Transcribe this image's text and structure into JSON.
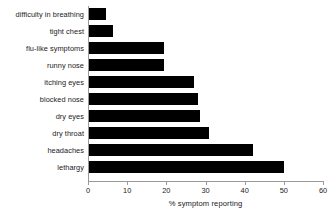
{
  "chart_data": {
    "type": "bar",
    "orientation": "horizontal",
    "title": "",
    "subtitle": "",
    "xlabel": "% symptom reporting",
    "ylabel": "",
    "categories": [
      "difficulty in breathing",
      "tight chest",
      "flu-like symptoms",
      "runny nose",
      "itching eyes",
      "blocked nose",
      "dry eyes",
      "dry throat",
      "headaches",
      "lethargy"
    ],
    "values": [
      4.5,
      6.5,
      19.5,
      19.5,
      27,
      28,
      28.5,
      31,
      42,
      50
    ],
    "xlim": [
      0,
      60
    ],
    "xticks": [
      0,
      10,
      20,
      30,
      40,
      50,
      60
    ],
    "xtick_labels": [
      "0",
      "10",
      "20",
      "30",
      "40",
      "50",
      "60"
    ],
    "grid": false,
    "legend": null,
    "bar_color": "#000000",
    "background_color": "#ffffff",
    "axis_color": "#9a9a9a",
    "annotations": []
  }
}
